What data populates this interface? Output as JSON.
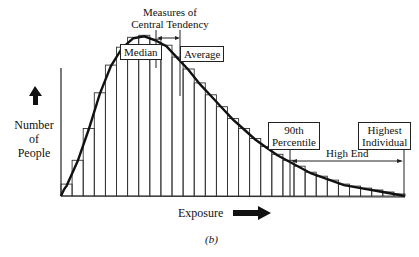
{
  "chart_data": {
    "type": "bar",
    "title": "Measures of Central Tendency",
    "xlabel": "Exposure",
    "ylabel": "Number of People",
    "caption": "(b)",
    "categories": [
      "1",
      "2",
      "3",
      "4",
      "5",
      "6",
      "7",
      "8",
      "9",
      "10",
      "11",
      "12",
      "13",
      "14",
      "15",
      "16",
      "17",
      "18",
      "19",
      "20",
      "21",
      "22",
      "23",
      "24",
      "25",
      "26",
      "27",
      "28",
      "29",
      "30",
      "31"
    ],
    "values": [
      6,
      18,
      34,
      52,
      66,
      75,
      80,
      81,
      79,
      76,
      70,
      64,
      57,
      51,
      45,
      39,
      34,
      29,
      25,
      21,
      18,
      15,
      12,
      10,
      8,
      6,
      5,
      4,
      3,
      2,
      1
    ],
    "ylim": [
      0,
      100
    ],
    "grid": false,
    "annotations": [
      {
        "label": "Median",
        "x_index": 8
      },
      {
        "label": "Average",
        "x_index": 11
      },
      {
        "label": "90th Percentile",
        "x_index": 21
      },
      {
        "label": "Highest Individual",
        "x_index": 31
      },
      {
        "label": "High End",
        "range": [
          21,
          31
        ]
      }
    ]
  },
  "labels": {
    "measures_line1": "Measures of",
    "measures_line2": "Central Tendency",
    "median": "Median",
    "average": "Average",
    "percentile_line1": "90th",
    "percentile_line2": "Percentile",
    "highest_line1": "Highest",
    "highest_line2": "Individual",
    "high_end": "High End",
    "ylabel_line1": "Number",
    "ylabel_line2": "of",
    "ylabel_line3": "People",
    "xlabel": "Exposure",
    "caption": "(b)"
  }
}
